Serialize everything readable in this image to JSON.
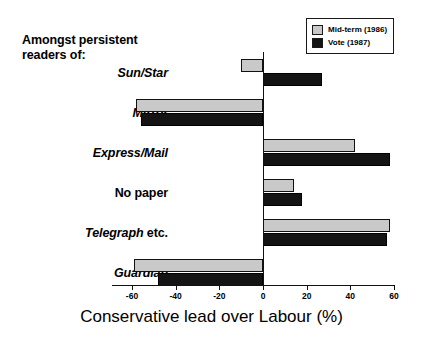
{
  "group_heading": "Amongst persistent\nreaders of:",
  "legend": {
    "position": "top-right",
    "items": [
      {
        "label": "Mid-term (1986)",
        "color": "#c9c9c9",
        "key": "midterm"
      },
      {
        "label": "Vote (1987)",
        "color": "#141414",
        "key": "vote"
      }
    ]
  },
  "axis": {
    "title": "Conservative lead over Labour (%)",
    "ticks": [
      "-60",
      "-40",
      "-20",
      "0",
      "20",
      "40",
      "60"
    ],
    "min": -60,
    "max": 60
  },
  "categories": [
    {
      "label": "Sun/Star",
      "italic": true,
      "suffix": ""
    },
    {
      "label": "Mirror",
      "italic": true,
      "suffix": ""
    },
    {
      "label": "Express/Mail",
      "italic": true,
      "suffix": ""
    },
    {
      "label": "No paper",
      "italic": false,
      "suffix": ""
    },
    {
      "label": "Telegraph",
      "italic": true,
      "suffix": " etc."
    },
    {
      "label": "Guardian",
      "italic": true,
      "suffix": ""
    }
  ],
  "chart_data": {
    "type": "bar",
    "orientation": "horizontal",
    "title": "",
    "xlabel": "Conservative lead over Labour (%)",
    "ylabel": "Amongst persistent readers of:",
    "xlim": [
      -60,
      60
    ],
    "xticks": [
      -60,
      -40,
      -20,
      0,
      20,
      40,
      60
    ],
    "grid": false,
    "legend_position": "top-right",
    "categories": [
      "Sun/Star",
      "Mirror",
      "Express/Mail",
      "No paper",
      "Telegraph etc.",
      "Guardian"
    ],
    "series": [
      {
        "name": "Mid-term (1986)",
        "color": "#c9c9c9",
        "values": [
          -10,
          -58,
          42,
          14,
          58,
          -59
        ]
      },
      {
        "name": "Vote (1987)",
        "color": "#141414",
        "values": [
          27,
          -56,
          58,
          18,
          57,
          -48
        ]
      }
    ]
  }
}
